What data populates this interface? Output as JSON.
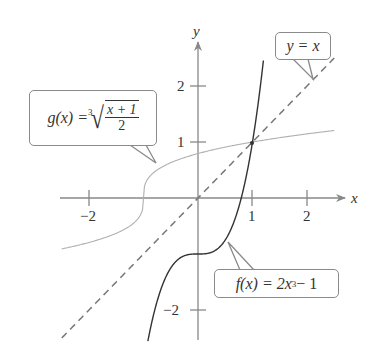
{
  "chart_data": {
    "type": "line",
    "title": "",
    "xlabel": "x",
    "ylabel": "y",
    "xlim": [
      -2.5,
      2.5
    ],
    "ylim": [
      -2.5,
      2.5
    ],
    "grid": false,
    "x_ticks": [
      -2,
      1,
      2
    ],
    "x_tick_labels": [
      "−2",
      "1",
      "2"
    ],
    "y_ticks": [
      -2,
      1,
      2
    ],
    "y_tick_labels": [
      "−2",
      "1",
      "2"
    ],
    "series": [
      {
        "name": "f(x) = 2x^3 − 1",
        "style": "solid dark",
        "color": "#333333",
        "x": [
          -0.92,
          -0.8,
          -0.6,
          -0.4,
          -0.2,
          0,
          0.2,
          0.4,
          0.6,
          0.8,
          1.0,
          1.1,
          1.2
        ],
        "y": [
          -2.56,
          -2.02,
          -1.43,
          -1.13,
          -1.02,
          -1.0,
          -0.98,
          -0.87,
          -0.57,
          0.02,
          1.0,
          1.66,
          2.46
        ]
      },
      {
        "name": "g(x) = cbrt((x+1)/2)",
        "style": "solid light gray",
        "color": "#b0b0b0",
        "x": [
          -2.5,
          -2,
          -1.5,
          -1.1,
          -1,
          -0.9,
          -0.5,
          0,
          0.5,
          1,
          1.5,
          2,
          2.5
        ],
        "y": [
          -0.91,
          -0.79,
          -0.63,
          -0.37,
          0,
          0.37,
          0.63,
          0.79,
          0.91,
          1.0,
          1.08,
          1.14,
          1.21
        ]
      },
      {
        "name": "y = x",
        "style": "dashed",
        "color": "#777777",
        "x": [
          -2.5,
          2.5
        ],
        "y": [
          -2.5,
          2.5
        ]
      }
    ],
    "annotations": [
      {
        "text": "g(x) = ∛((x + 1)/2)",
        "points_to": "g curve near (-0.8, 0.6)"
      },
      {
        "text": "y = x",
        "points_to": "dashed line near (2.1, 2.1)"
      },
      {
        "text": "f(x) = 2x³ − 1",
        "points_to": "f curve near (0.55, -0.8)"
      }
    ],
    "intersection_point": {
      "x": 1,
      "y": 1
    }
  },
  "labels": {
    "x_axis": "x",
    "y_axis": "y",
    "tick_x_neg2": "−2",
    "tick_x_1": "1",
    "tick_x_2": "2",
    "tick_y_2": "2",
    "tick_y_1": "1",
    "tick_y_neg2": "−2"
  },
  "callouts": {
    "g": {
      "lhs": "g(x) = ",
      "index": "3",
      "num": "x + 1",
      "den": "2"
    },
    "identity": {
      "text": "y = x"
    },
    "f": {
      "lhs": "f(x) = 2x",
      "exp": "3",
      "rhs": " − 1"
    }
  }
}
